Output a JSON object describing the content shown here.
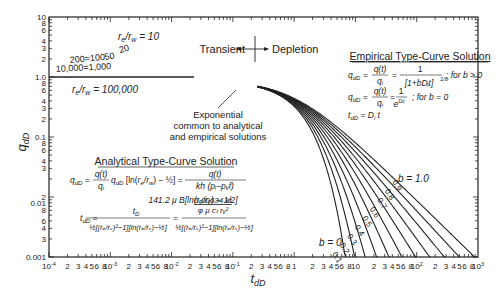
{
  "chart_data": {
    "type": "line",
    "title": "",
    "xlabel": "t_dD",
    "ylabel": "q_dD",
    "xscale": "log",
    "yscale": "log",
    "xlim": [
      0.0001,
      1000
    ],
    "ylim": [
      0.001,
      10
    ],
    "x_ticks": [
      "10^-4",
      "2",
      "3",
      "4",
      "5",
      "6",
      "8",
      "10^-3",
      "2",
      "3",
      "4",
      "5",
      "6",
      "8",
      "10^-2",
      "2",
      "3",
      "4",
      "5",
      "6",
      "8",
      "10^-1",
      "2",
      "3",
      "4",
      "5",
      "6",
      "8",
      "1",
      "2",
      "3",
      "4",
      "5",
      "6",
      "8",
      "10",
      "2",
      "3",
      "4",
      "5",
      "6",
      "8",
      "10^2",
      "2",
      "3",
      "4",
      "5",
      "6",
      "8",
      "10^3"
    ],
    "y_ticks": [
      "10",
      "8",
      "6",
      "4",
      "3",
      "2",
      "1.0",
      "8",
      "6",
      "4",
      "3",
      "2",
      "0.1",
      "8",
      "6",
      "4",
      "3",
      "2",
      "0.01",
      "8",
      "6",
      "4",
      "3",
      "0.001"
    ],
    "grid": false,
    "annotations": {
      "transient": "Transient",
      "depletion": "Depletion",
      "exponential": [
        "Exponential",
        "common to analytical",
        "and empirical solutions"
      ],
      "re_rw_10": "r_e/r_w = 10",
      "re_rw_100000": "r_e/r_w = 100,000",
      "b_1": "b = 1.0",
      "b_0": "b = 0"
    },
    "transient_series": [
      {
        "name": "r_e/r_w = 10",
        "label": "10"
      },
      {
        "name": "r_e/r_w = 20",
        "label": "20"
      },
      {
        "name": "r_e/r_w = 50",
        "label": "50"
      },
      {
        "name": "r_e/r_w = 100",
        "label": "100"
      },
      {
        "name": "r_e/r_w = 200",
        "label": "200"
      },
      {
        "name": "r_e/r_w = 1,000",
        "label": "1,000"
      },
      {
        "name": "r_e/r_w = 10,000",
        "label": "10,000"
      },
      {
        "name": "r_e/r_w = 100,000",
        "label": "100,000"
      }
    ],
    "depletion_series": [
      {
        "name": "b = 0",
        "label": "0"
      },
      {
        "name": "b = 0.1",
        "label": "0.1"
      },
      {
        "name": "b = 0.2",
        "label": "0.2"
      },
      {
        "name": "b = 0.3",
        "label": "0.3"
      },
      {
        "name": "b = 0.4",
        "label": "0.4"
      },
      {
        "name": "b = 0.5",
        "label": "0.5"
      },
      {
        "name": "b = 0.6",
        "label": "0.6"
      },
      {
        "name": "b = 0.7",
        "label": "0.7"
      },
      {
        "name": "b = 0.8",
        "label": "0.8"
      },
      {
        "name": "b = 0.9",
        "label": "0.9"
      },
      {
        "name": "b = 1.0",
        "label": "1.0"
      }
    ],
    "sample_points": {
      "note": "approximate readings off the plot",
      "transient_start_at_x_1e-4": {
        "10": 9.5,
        "20": 5.5,
        "50": 3.5,
        "100": 2.8,
        "200": 2.2,
        "1,000": 1.6,
        "10,000": 1.3,
        "100,000": 1.1
      },
      "depletion_end_x_at_y_0.001": {
        "0": 7,
        "0.1": 9,
        "0.2": 11,
        "0.3": 15,
        "0.4": 20,
        "0.5": 30,
        "0.6": 45,
        "0.7": 80,
        "0.8": 150,
        "0.9": 350,
        "1.0": 1000
      }
    }
  },
  "labels": {
    "ylabel_main": "q",
    "ylabel_sub": "dD",
    "xlabel_main": "t",
    "xlabel_sub": "dD",
    "transient": "Transient",
    "depletion": "Depletion",
    "exp1": "Exponential",
    "exp2": "common to analytical",
    "exp3": "and empirical solutions",
    "re_rw_10": "rₑ/rᵥ = 10",
    "re_rw_100000": "rₑ/rᵥ = 100,000",
    "lbl_20": "20",
    "lbl_50": "50",
    "lbl_200_100": "200=100",
    "lbl_10000_1000": "10,000=1,000",
    "b_1": "b = 1.0",
    "b_0": "b = 0",
    "b_labels": [
      "0.9",
      "0.8",
      "0.7",
      "0.6",
      "0.5",
      "0.4",
      "0.3",
      "0.2",
      "0.1"
    ]
  },
  "empirical": {
    "title": "Empirical Type-Curve Solution",
    "eq1_lhs": "qₑD = q(t)/qᵢ =",
    "eq1_cond": "; for b > 0",
    "eq1_num": "1",
    "eq1_den": "[1+bDᵢt]",
    "eq1_exp": "1/b",
    "eq2_lhs": "qₑD = q(t)/qᵢ = 1/e",
    "eq2_exp": "Dᵢt",
    "eq2_cond": "; for b = 0",
    "eq3": "tₑD = Dᵢ t"
  },
  "analytical": {
    "title": "Analytical Type-Curve Solution",
    "eq1_lhs": "qₑD =",
    "eq1_frac_num": "q(t)",
    "eq1_frac_den": "qᵢ",
    "eq1_mid": "qₑD [ln(rₑ/rᵥ) − 1/2] =",
    "eq1_rhs_num": "q(t)",
    "eq1_rhs_den1": "kh (pᵢ−pᵥf)",
    "eq1_rhs_den2": "141.2 μ B[ln(rₑ/rᵥ) − 1/2]",
    "eq2_lhs": "tₑD =",
    "eq2_num": "tᴅ",
    "eq2_den": "½[(rₑ/rᵥ)²−1][ln(rₑ/rᵥ)−½]",
    "eq2_rhs_num_top": "0.00634 kt",
    "eq2_rhs_num_bot": "φ μ cₜ rᵥ²",
    "eq2_rhs_den": "½[(rₑ/rᵥ)²−1][ln(rₑ/rᵥ)−½]"
  },
  "colors": {
    "line": "#222222",
    "background": "#ffffff",
    "text": "#222222"
  }
}
